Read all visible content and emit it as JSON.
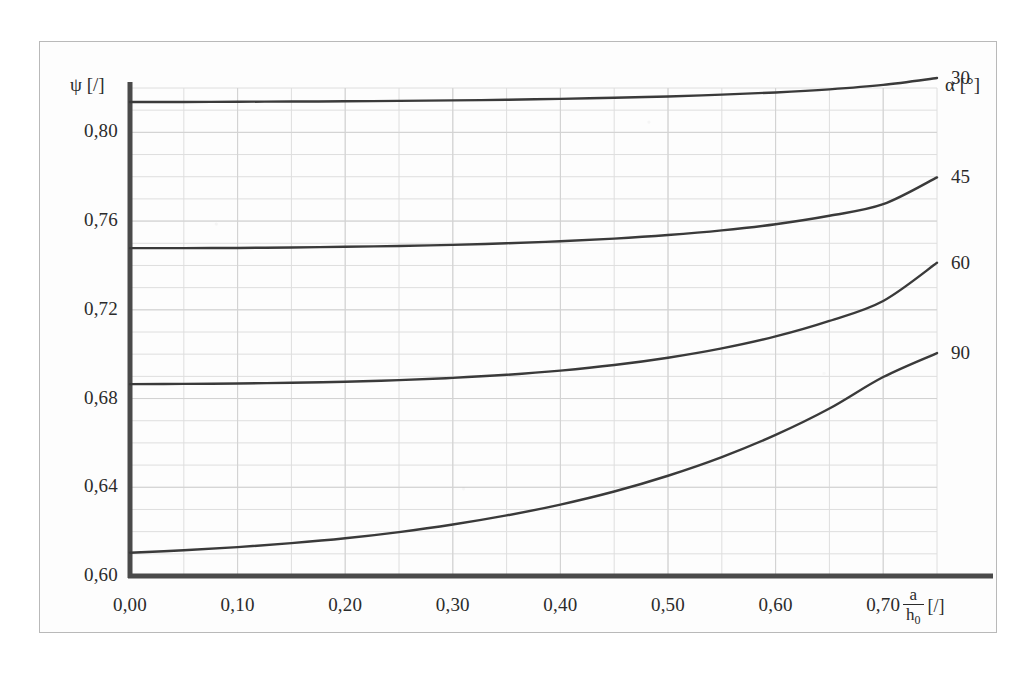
{
  "chart_data": {
    "type": "line",
    "title": "",
    "subtitle": "",
    "xlabel": "a/h₀ [/]",
    "xlabel_numerator": "a",
    "xlabel_denominator": "h",
    "xlabel_denominator_sub": "0",
    "xlabel_unit": "[/]",
    "ylabel": "ψ [/]",
    "legend_title": "α [°]",
    "legend_position": "right",
    "grid": true,
    "grid_minor_x_step": 0.05,
    "grid_minor_y_step": 0.01,
    "xlim": [
      0.0,
      0.75
    ],
    "ylim": [
      0.6,
      0.82
    ],
    "xticks": [
      "0,00",
      "0,10",
      "0,20",
      "0,30",
      "0,40",
      "0,50",
      "0,60",
      "0,70"
    ],
    "xtick_values": [
      0.0,
      0.1,
      0.2,
      0.3,
      0.4,
      0.5,
      0.6,
      0.7
    ],
    "yticks": [
      "0,60",
      "0,64",
      "0,68",
      "0,72",
      "0,76",
      "0,80"
    ],
    "ytick_values": [
      0.6,
      0.64,
      0.68,
      0.72,
      0.76,
      0.8
    ],
    "x": [
      0.0,
      0.05,
      0.1,
      0.15,
      0.2,
      0.25,
      0.3,
      0.35,
      0.4,
      0.45,
      0.5,
      0.55,
      0.6,
      0.65,
      0.7,
      0.75
    ],
    "series": [
      {
        "name": "30",
        "label": "30",
        "color": "#3a3a3a",
        "values": [
          0.8137,
          0.8137,
          0.8138,
          0.8139,
          0.814,
          0.8142,
          0.8144,
          0.8147,
          0.8151,
          0.8156,
          0.8162,
          0.817,
          0.818,
          0.8194,
          0.8214,
          0.8245
        ]
      },
      {
        "name": "45",
        "label": "45",
        "color": "#3a3a3a",
        "values": [
          0.7478,
          0.7478,
          0.7479,
          0.7481,
          0.7484,
          0.7488,
          0.7493,
          0.75,
          0.7509,
          0.7521,
          0.7537,
          0.7558,
          0.7586,
          0.7624,
          0.7676,
          0.7797
        ]
      },
      {
        "name": "60",
        "label": "60",
        "color": "#3a3a3a",
        "values": [
          0.6865,
          0.6866,
          0.6868,
          0.6871,
          0.6876,
          0.6883,
          0.6893,
          0.6907,
          0.6926,
          0.6951,
          0.6984,
          0.7026,
          0.708,
          0.715,
          0.724,
          0.7412
        ]
      },
      {
        "name": "90",
        "label": "90",
        "color": "#3a3a3a",
        "values": [
          0.6105,
          0.6116,
          0.613,
          0.6148,
          0.617,
          0.6198,
          0.6232,
          0.6273,
          0.6322,
          0.6381,
          0.6452,
          0.6536,
          0.6636,
          0.6755,
          0.6897,
          0.7005
        ]
      }
    ]
  },
  "axes": {
    "y_axis_name": "ψ [/]",
    "legend_header": "α [°]"
  },
  "colors": {
    "curve": "#3a3a3a",
    "axis": "#4a4a4a",
    "grid": "#dedede",
    "frame": "#b9b9b9",
    "text": "#2b2b2b",
    "background": "#ffffff"
  }
}
